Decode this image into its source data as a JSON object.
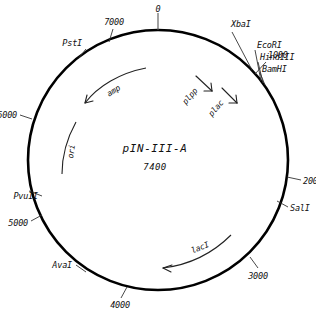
{
  "diagram": {
    "type": "plasmid-map",
    "title": "pIN-III-A",
    "size_bp": "7400",
    "background_color": "#ffffff",
    "line_color": "#000000"
  },
  "center": {
    "name": "pIN-III-A",
    "size": "7400"
  },
  "scale_ticks": [
    {
      "label": "0",
      "position_deg": 0
    },
    {
      "label": "1000",
      "position_deg": 48
    },
    {
      "label": "2000",
      "position_deg": 97
    },
    {
      "label": "3000",
      "position_deg": 145
    },
    {
      "label": "4000",
      "position_deg": 194
    },
    {
      "label": "5000",
      "position_deg": 243
    },
    {
      "label": "6000",
      "position_deg": 292
    },
    {
      "label": "7000",
      "position_deg": 340
    }
  ],
  "restriction_sites": [
    {
      "label": "XbaI",
      "position_deg": 43
    },
    {
      "label": "EcoRI",
      "position_deg": 52
    },
    {
      "label": "HindIII",
      "position_deg": 55
    },
    {
      "label": "BamHI",
      "position_deg": 58
    },
    {
      "label": "SalI",
      "position_deg": 108
    },
    {
      "label": "AvaI",
      "position_deg": 226
    },
    {
      "label": "PvuII",
      "position_deg": 263
    },
    {
      "label": "PstI",
      "position_deg": 328
    }
  ],
  "features": [
    {
      "label": "plpp",
      "kind": "promoter"
    },
    {
      "label": "plac",
      "kind": "promoter"
    },
    {
      "label": "amp",
      "kind": "gene"
    },
    {
      "label": "ori",
      "kind": "origin"
    },
    {
      "label": "lacI",
      "kind": "gene"
    }
  ]
}
